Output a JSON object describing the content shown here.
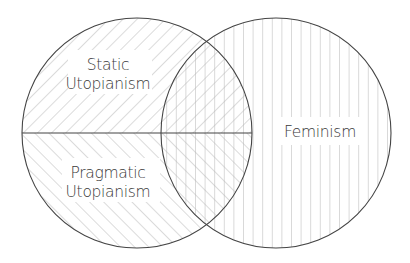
{
  "diagram": {
    "type": "venn",
    "circles": [
      {
        "id": "utopianism",
        "halves": [
          {
            "label_lines": [
              "Static",
              "Utopianism"
            ],
            "pattern": "diagonal-forward"
          },
          {
            "label_lines": [
              "Pragmatic",
              "Utopianism"
            ],
            "pattern": "diagonal-backward"
          }
        ]
      },
      {
        "id": "feminism",
        "label": "Feminism",
        "pattern": "vertical"
      }
    ],
    "colors": {
      "outline": "#444444",
      "hatch": "#b5b5b5",
      "text": "#3a3a3a",
      "background": "#ffffff"
    }
  }
}
